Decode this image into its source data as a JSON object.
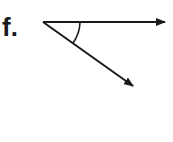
{
  "label": "f.",
  "figure": {
    "type": "angle",
    "vertex": [
      43,
      22
    ],
    "ray1_end": [
      165,
      22
    ],
    "ray2_end": [
      133,
      86
    ],
    "angle_marked": true,
    "stroke_color": "#1a1a1a"
  }
}
